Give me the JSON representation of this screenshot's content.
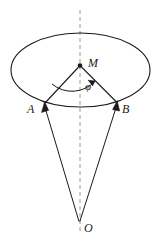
{
  "figure": {
    "background_color": "#ffffff",
    "stroke_color": "#1a1a1a",
    "labels": {
      "apex": "O",
      "center_top": "M",
      "left_point": "A",
      "right_point": "B",
      "angle": "φ"
    },
    "icons": {
      "axis": "dashed-vertical-axis",
      "base": "ellipse-outline",
      "left_vector": "arrow-up-left",
      "right_vector": "arrow-up-right",
      "angle_marker": "curved-arc-arrow"
    },
    "geometry": {
      "ellipse": {
        "cx": 80.5,
        "cy": 70,
        "rx": 69.5,
        "ry": 37
      },
      "point_M": {
        "x": 80,
        "y": 65
      },
      "point_A": {
        "x": 45,
        "y": 104
      },
      "point_B": {
        "x": 117,
        "y": 103
      },
      "point_O": {
        "x": 79,
        "y": 222
      },
      "axis_line": {
        "x": 80,
        "y1": 10,
        "y2": 232
      },
      "angle_arc": {
        "start_deg": 180,
        "end_deg": 62,
        "radius": 31
      }
    }
  }
}
